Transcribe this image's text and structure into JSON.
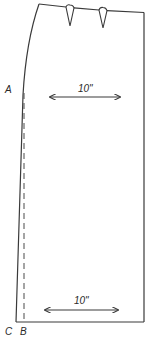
{
  "diagram": {
    "type": "sewing-pattern",
    "colors": {
      "line": "#3a3a3a",
      "background": "#ffffff"
    },
    "points": [
      {
        "id": "A",
        "label": "A"
      },
      {
        "id": "B",
        "label": "B"
      },
      {
        "id": "C",
        "label": "C"
      }
    ],
    "measurements": [
      {
        "id": "hip",
        "label": "10\""
      },
      {
        "id": "hem",
        "label": "10\""
      }
    ],
    "darts": 2
  }
}
